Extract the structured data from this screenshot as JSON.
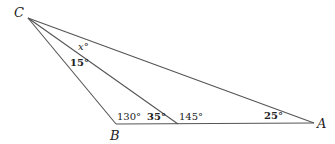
{
  "diagram": {
    "vertices": {
      "C": {
        "label": "C",
        "x": 28,
        "y": 18
      },
      "B": {
        "label": "B",
        "x": 116,
        "y": 124
      },
      "D": {
        "label": "",
        "x": 178,
        "y": 124
      },
      "A": {
        "label": "A",
        "x": 314,
        "y": 123
      }
    },
    "segments": [
      [
        "C",
        "B"
      ],
      [
        "C",
        "D"
      ],
      [
        "C",
        "A"
      ],
      [
        "B",
        "A"
      ]
    ],
    "angles": {
      "x": "x°",
      "bcd": "15°",
      "cbd": "130°",
      "cdb": "35°",
      "cda": "145°",
      "cab": "25°"
    },
    "stroke_color": "#555555"
  }
}
